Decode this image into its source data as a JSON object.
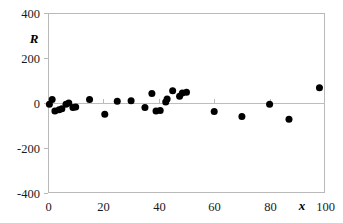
{
  "chart_data": {
    "type": "scatter",
    "title": "",
    "subtitle": "",
    "xlabel": "x",
    "ylabel": "R",
    "xlim": [
      0,
      100
    ],
    "ylim": [
      -400,
      400
    ],
    "grid": false,
    "legend": null,
    "legend_position": "none",
    "x_ticks": [
      0,
      20,
      40,
      60,
      80,
      100
    ],
    "x_tick_labels": [
      "0",
      "20",
      "40",
      "60",
      "80",
      "100"
    ],
    "y_ticks": [
      -400,
      -200,
      0,
      200,
      400
    ],
    "y_tick_labels": [
      "-400",
      "-200",
      "0",
      "200",
      "400"
    ],
    "zero_reference_line": 0,
    "marker": {
      "shape": "circle",
      "color": "#000000",
      "size_px": 7
    },
    "series": [
      {
        "name": "Residuals",
        "color": "#000000",
        "points": [
          {
            "x": 0.5,
            "y": -5
          },
          {
            "x": 1.5,
            "y": 15
          },
          {
            "x": 2.5,
            "y": -35
          },
          {
            "x": 4.0,
            "y": -30
          },
          {
            "x": 5.0,
            "y": -25
          },
          {
            "x": 6.5,
            "y": -5
          },
          {
            "x": 7.5,
            "y": 0
          },
          {
            "x": 9.0,
            "y": -20
          },
          {
            "x": 10.0,
            "y": -18
          },
          {
            "x": 15.0,
            "y": 15
          },
          {
            "x": 20.5,
            "y": -50
          },
          {
            "x": 25.0,
            "y": 8
          },
          {
            "x": 30.0,
            "y": 10
          },
          {
            "x": 35.0,
            "y": -20
          },
          {
            "x": 37.5,
            "y": 42
          },
          {
            "x": 39.0,
            "y": -35
          },
          {
            "x": 40.5,
            "y": -33
          },
          {
            "x": 42.5,
            "y": 5
          },
          {
            "x": 43.0,
            "y": 18
          },
          {
            "x": 45.0,
            "y": 55
          },
          {
            "x": 47.5,
            "y": 30
          },
          {
            "x": 48.5,
            "y": 45
          },
          {
            "x": 50.0,
            "y": 48
          },
          {
            "x": 60.0,
            "y": -38
          },
          {
            "x": 70.0,
            "y": -60
          },
          {
            "x": 80.0,
            "y": -5
          },
          {
            "x": 87.0,
            "y": -72
          },
          {
            "x": 98.0,
            "y": 68
          }
        ]
      }
    ]
  },
  "plot_area": {
    "left_px": 48,
    "right_px": 325,
    "top_px": 13,
    "bottom_px": 193
  }
}
